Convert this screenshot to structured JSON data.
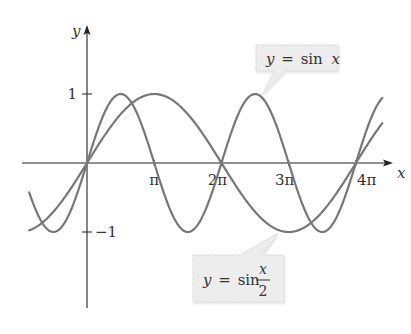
{
  "chart_data": {
    "type": "line",
    "title": "",
    "xlabel": "x",
    "ylabel": "y",
    "xlim": [
      -2.7,
      13.8
    ],
    "ylim": [
      -1,
      1
    ],
    "grid": false,
    "x_ticks": [
      {
        "value": 3.14159,
        "label": "π"
      },
      {
        "value": 6.28319,
        "label": "2π"
      },
      {
        "value": 9.42478,
        "label": "3π"
      },
      {
        "value": 12.56637,
        "label": "4π"
      }
    ],
    "y_ticks": [
      {
        "value": 1,
        "label": "1"
      },
      {
        "value": -1,
        "label": "−1"
      }
    ],
    "series": [
      {
        "name": "y = sin x",
        "function": "sin(x)",
        "x_range": [
          -2.7,
          13.8
        ]
      },
      {
        "name": "y = sin x/2",
        "function": "sin(x/2)",
        "x_range": [
          -2.7,
          13.8
        ]
      }
    ],
    "annotations": [
      {
        "target_series": "y = sin x",
        "text_lhs": "y",
        "text_eq": "=",
        "text_fn": "sin",
        "text_arg": "x",
        "anchor": "top-right"
      },
      {
        "target_series": "y = sin x/2",
        "text_lhs": "y",
        "text_eq": "=",
        "text_fn": "sin",
        "text_num": "x",
        "text_den": "2",
        "anchor": "bottom-right"
      }
    ]
  }
}
